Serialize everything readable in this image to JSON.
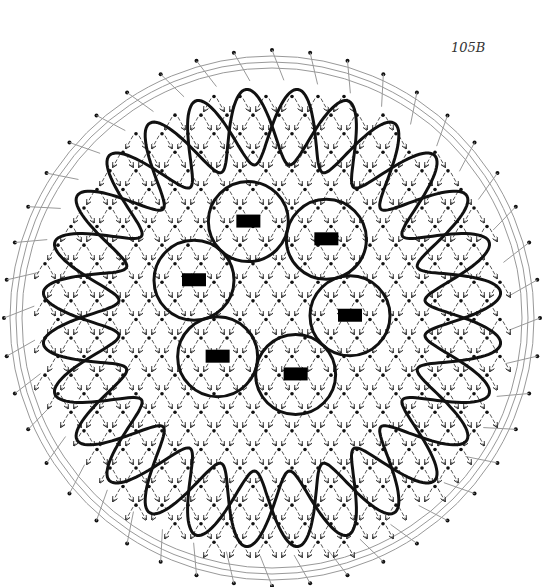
{
  "diagram": {
    "label": "105B",
    "colors": {
      "background": "#ffffff",
      "thick_line": "#111111",
      "thin_line": "#999999",
      "dot": "#111111",
      "rect": "#000000"
    },
    "center": [
      272,
      318
    ],
    "outer_radius": 262,
    "outer_loops": 14,
    "outer_loop_radius": 232,
    "inner_circles": 6,
    "inner_circle_radius": 80
  }
}
